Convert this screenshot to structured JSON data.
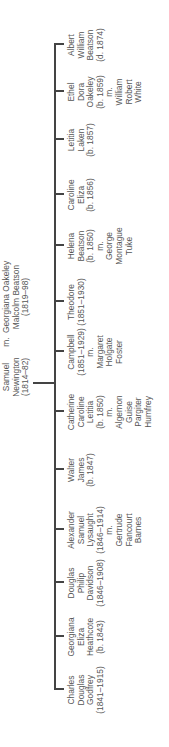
{
  "parents": {
    "father": {
      "lines": [
        "Samuel",
        "Newington",
        "(1814–82)"
      ]
    },
    "marriage": "m.",
    "mother": {
      "lines": [
        "Georgiana Oakeley",
        "Malcolm Beatson",
        "(1819–98)"
      ]
    }
  },
  "children": [
    {
      "lines": [
        "Charles",
        "Douglas",
        "Godfrey",
        "(1841–1915)"
      ],
      "spouse": []
    },
    {
      "lines": [
        "Georgiana",
        "Eliza",
        "Heathcote",
        "(b. 1843)"
      ],
      "spouse": []
    },
    {
      "lines": [
        "Douglas",
        "Philip",
        "Davidson",
        "(1846–1908)"
      ],
      "spouse": []
    },
    {
      "lines": [
        "Alexander",
        "Samuel",
        "Lysaught",
        "(1846–1914)"
      ],
      "marriage": "m.",
      "spouse": [
        "Gertrude",
        "Fancourt",
        "Barnes"
      ]
    },
    {
      "lines": [
        "Walter",
        "James",
        "(b. 1847)"
      ],
      "spouse": []
    },
    {
      "lines": [
        "Catherine",
        "Caroline",
        "Letitia",
        "(b. 1850)"
      ],
      "marriage": "m.",
      "spouse": [
        "Algernon",
        "Guise",
        "Pargiter",
        "Humfrey"
      ]
    },
    {
      "lines": [
        "Campbell",
        "(1851–1929)"
      ],
      "marriage": "m.",
      "spouse": [
        "Margaret",
        "Holgate",
        "Foster"
      ]
    },
    {
      "lines": [
        "Theodore",
        "(1851–1930)"
      ],
      "spouse": []
    },
    {
      "lines": [
        "Helena",
        "Beatson",
        "(b. 1850)"
      ],
      "marriage": "m.",
      "spouse": [
        "George",
        "Montague",
        "Tuke"
      ]
    },
    {
      "lines": [
        "Caroline",
        "Eliza",
        "(b. 1856)"
      ],
      "spouse": []
    },
    {
      "lines": [
        "Letitia",
        "Laken",
        "(b. 1857)"
      ],
      "spouse": []
    },
    {
      "lines": [
        "Ethel",
        "Dora",
        "Oakeley",
        "(b. 1859)"
      ],
      "marriage": "m.",
      "spouse": [
        "William",
        "Robert",
        "White"
      ]
    },
    {
      "lines": [
        "Albert",
        "William",
        "Beatson",
        "(d. 1874)"
      ],
      "spouse": []
    }
  ]
}
